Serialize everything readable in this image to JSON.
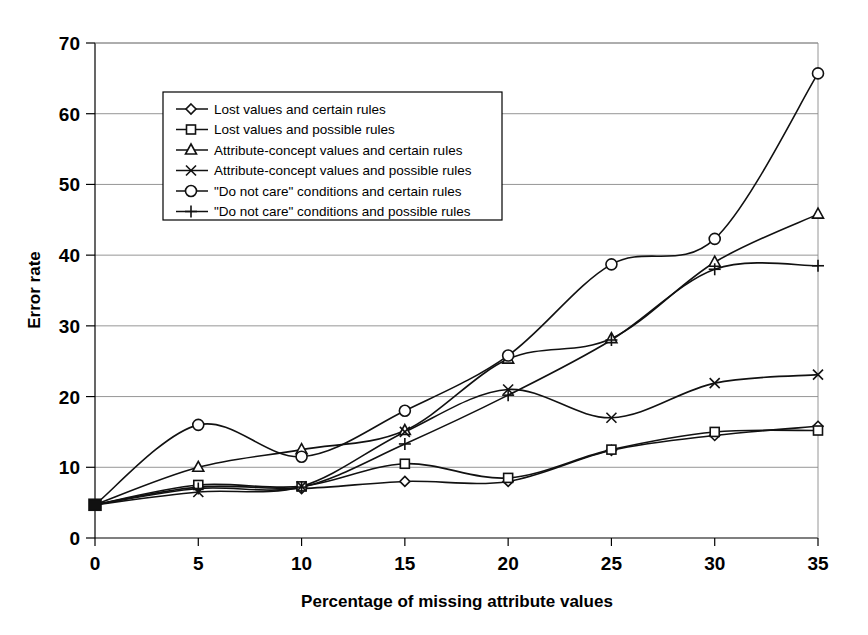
{
  "chart_data": {
    "type": "line",
    "title": "",
    "subtitle": "",
    "xlabel": "Percentage of missing attribute values",
    "ylabel": "Error rate",
    "x": [
      0,
      5,
      10,
      15,
      20,
      25,
      30,
      35
    ],
    "xlim": [
      0,
      35
    ],
    "ylim": [
      0,
      70
    ],
    "xticks": [
      "0",
      "5",
      "10",
      "15",
      "20",
      "25",
      "30",
      "35"
    ],
    "yticks": [
      "0",
      "10",
      "20",
      "30",
      "40",
      "50",
      "60",
      "70"
    ],
    "grid": "horizontal",
    "legend_position": "upper-left-inside",
    "series": [
      {
        "name": "Lost values and certain rules",
        "marker": "diamond",
        "values": [
          4.7,
          7.2,
          7.0,
          8.0,
          8.0,
          12.4,
          14.5,
          15.8
        ]
      },
      {
        "name": "Lost values and possible rules",
        "marker": "square",
        "values": [
          4.7,
          7.5,
          7.3,
          10.5,
          8.5,
          12.5,
          15.0,
          15.2
        ]
      },
      {
        "name": "Attribute-concept values and certain rules",
        "marker": "triangle",
        "values": [
          4.7,
          10.0,
          12.5,
          15.2,
          25.3,
          28.2,
          39.0,
          45.8
        ]
      },
      {
        "name": "Attribute-concept values and possible rules",
        "marker": "x",
        "values": [
          4.7,
          6.5,
          7.3,
          15.0,
          21.0,
          17.0,
          21.9,
          23.1
        ]
      },
      {
        "name": "\"Do not care\" conditions and certain rules",
        "marker": "circle",
        "values": [
          4.7,
          16.0,
          11.5,
          18.0,
          25.8,
          38.7,
          42.3,
          65.7
        ]
      },
      {
        "name": "\"Do not care\" conditions and possible rules",
        "marker": "plus",
        "values": [
          4.7,
          7.0,
          7.2,
          13.3,
          20.2,
          28.0,
          38.0,
          38.5
        ]
      }
    ]
  },
  "legend": {
    "entries": [
      "Lost values and certain rules",
      "Lost values and possible rules",
      "Attribute-concept values and certain rules",
      "Attribute-concept values and possible rules",
      "\"Do not care\" conditions and certain rules",
      "\"Do not care\" conditions and possible rules"
    ]
  },
  "axes": {
    "y_title": "Error rate",
    "x_title": "Percentage of missing attribute values"
  }
}
